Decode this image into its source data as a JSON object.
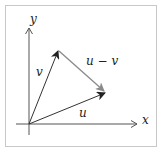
{
  "diagram": {
    "type": "vector-subtraction",
    "colors": {
      "frame": "#c8c8c8",
      "axis": "#555555",
      "vector": "#333333",
      "difference_vector": "#8a8a8a",
      "text": "#222222"
    },
    "axes": {
      "x_label": "x",
      "y_label": "y",
      "origin": [
        29,
        124
      ]
    },
    "vectors": [
      {
        "name": "u",
        "label": "u",
        "from": [
          29,
          124
        ],
        "to": [
          105,
          93
        ]
      },
      {
        "name": "v",
        "label": "v",
        "from": [
          29,
          124
        ],
        "to": [
          58,
          51
        ]
      },
      {
        "name": "u_minus_v",
        "label": "u − v",
        "from": [
          58,
          51
        ],
        "to": [
          104,
          91
        ]
      }
    ]
  }
}
